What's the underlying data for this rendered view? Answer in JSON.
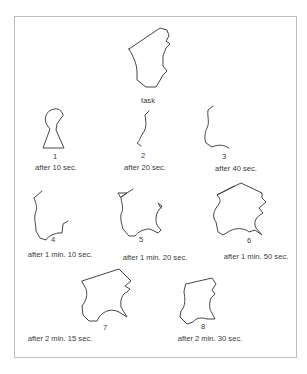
{
  "figure": {
    "task_label": "task",
    "stages": [
      {
        "number": "1",
        "caption": "after 10 sec."
      },
      {
        "number": "2",
        "caption": "after 20 sec."
      },
      {
        "number": "3",
        "caption": "after 40 sec."
      },
      {
        "number": "4",
        "caption": "after 1 min. 10 sec."
      },
      {
        "number": "5",
        "caption": "after 1 min. 20 sec."
      },
      {
        "number": "6",
        "caption": "after 1 min. 50 sec."
      },
      {
        "number": "7",
        "caption": "after 2 min. 15 sec."
      },
      {
        "number": "8",
        "caption": "after 2 min. 30 sec."
      }
    ],
    "colors": {
      "line": "#3c3c3c",
      "border": "#bdbdbd",
      "text": "#3a3a3a"
    }
  }
}
